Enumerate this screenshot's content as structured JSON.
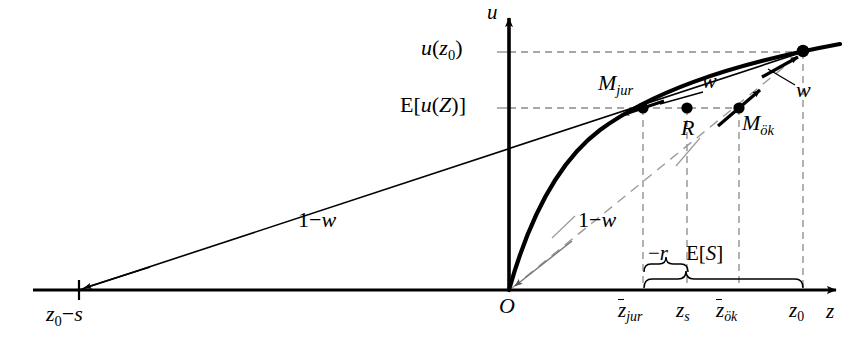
{
  "figure": {
    "axes": {
      "y_axis_label": "u",
      "x_axis_label": "z",
      "origin_label": "O"
    },
    "y_ticks": [
      {
        "id": "u-z0",
        "label": "u(z₀)",
        "y": 52
      },
      {
        "id": "E-u-Z",
        "label": "E[u(Z)]",
        "y": 108
      }
    ],
    "x_ticks": [
      {
        "id": "z0-minus-s",
        "label": "z₀−s",
        "x": 79
      },
      {
        "id": "z-bar-jur",
        "label": "z̄_jur",
        "x": 643
      },
      {
        "id": "z-s",
        "label": "z_s",
        "x": 687
      },
      {
        "id": "z-bar-oek",
        "label": "z̄_ök",
        "x": 739
      },
      {
        "id": "z-0",
        "label": "z₀",
        "x": 803
      }
    ],
    "points": [
      {
        "id": "M-jur",
        "label": "M_jur",
        "x": 643,
        "y": 108
      },
      {
        "id": "R",
        "label": "R",
        "x": 687,
        "y": 108
      },
      {
        "id": "M-oek",
        "label": "M_ök",
        "x": 739,
        "y": 108
      },
      {
        "id": "upper-right",
        "label": "",
        "x": 803,
        "y": 51
      }
    ],
    "weight_labels": [
      {
        "id": "w-left",
        "label": "w",
        "x": 689,
        "y": 84
      },
      {
        "id": "w-right",
        "label": "w",
        "x": 789,
        "y": 93
      },
      {
        "id": "one-minus-w-left",
        "label": "1−w",
        "x": 300,
        "y": 212
      },
      {
        "id": "one-minus-w-right",
        "label": "1−w",
        "x": 580,
        "y": 212
      }
    ],
    "braces": [
      {
        "id": "brace-minus-r",
        "label": "−r",
        "from_x": 643,
        "to_x": 687,
        "label_x": 655,
        "label_y": 246
      },
      {
        "id": "brace-E-S",
        "label": "E[S]",
        "from_x": 643,
        "to_x": 803,
        "label_x": 692,
        "label_y": 246
      }
    ],
    "colors": {
      "stroke": "#000000",
      "dashed_grid": "#8a8a8a",
      "background": "#ffffff"
    }
  }
}
